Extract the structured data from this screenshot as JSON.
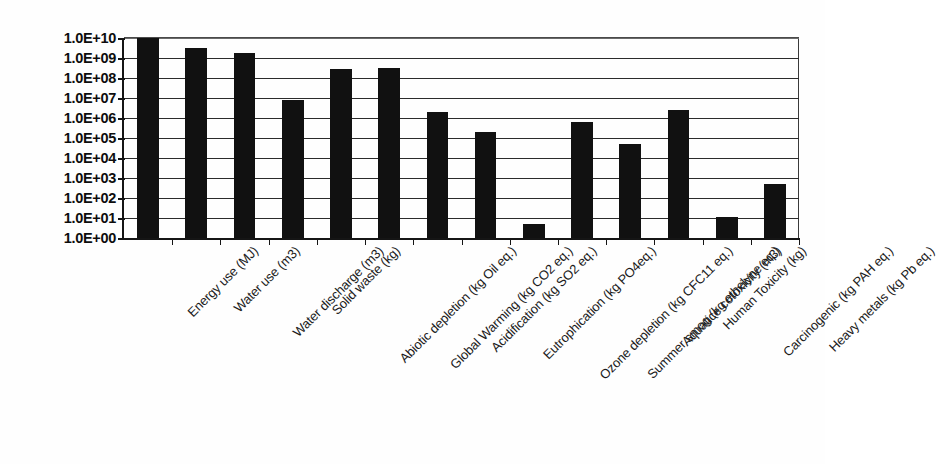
{
  "chart_data": {
    "type": "bar",
    "title": "",
    "subtitle": "",
    "xlabel": "",
    "ylabel": "",
    "scale": "log10",
    "ylim": [
      1,
      10000000000
    ],
    "grid": true,
    "legend": false,
    "legend_position": "none",
    "orientation": "vertical",
    "bar_color": "#111111",
    "gridline_color": "#2b2b2b",
    "axis_color": "#151515",
    "ytick_labels": [
      "1.0E+10",
      "1.0E+09",
      "1.0E+08",
      "1.0E+07",
      "1.0E+06",
      "1.0E+05",
      "1.0E+04",
      "1.0E+03",
      "1.0E+02",
      "1.0E+01",
      "1.0E+00"
    ],
    "ytick_values": [
      10000000000,
      1000000000,
      100000000,
      10000000,
      1000000,
      100000,
      10000,
      1000,
      100,
      10,
      1
    ],
    "categories": [
      "Energy use (MJ)",
      "Water use (m3)",
      "Water discharge (m3)",
      "Solid waste (kg)",
      "Abiotic depletion (kg Oil eq.)",
      "Global Warming (kg CO2 eq.)",
      "Acidification (kg SO2 eq.)",
      "Eutrophication (kg PO4eq.)",
      "Ozone depletion (kg CFC11 eq.)",
      "Summer smog (kg ethelyne eq.)",
      "Aquatice cotoxicity (m3)",
      "Human Toxicity (kg)",
      "Carcinogenic (kg PAH eq.)",
      "Heavy metals (kg Pb eq.)"
    ],
    "values": [
      10000000000,
      3000000000,
      1800000000,
      8000000,
      280000000,
      300000000,
      2000000,
      200000,
      5,
      600000,
      50000,
      2500000,
      11,
      500
    ]
  }
}
